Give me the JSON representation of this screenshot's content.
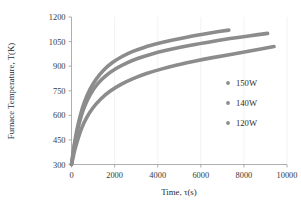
{
  "chart_data": {
    "type": "line",
    "title": "",
    "xlabel": "Time, τ(s)",
    "ylabel": "Furnace Temperature, T(K)",
    "xlim": [
      0,
      10000
    ],
    "ylim": [
      300,
      1200
    ],
    "xticks": [
      0,
      2000,
      4000,
      6000,
      8000,
      10000
    ],
    "yticks": [
      300,
      450,
      600,
      750,
      900,
      1050,
      1200
    ],
    "xtick_labels": [
      "0",
      "2000",
      "4000",
      "6000",
      "8000",
      "10000"
    ],
    "ytick_labels": [
      "300",
      "450",
      "600",
      "750",
      "900",
      "1050",
      "1200"
    ],
    "grid": "vertical-only",
    "legend_position": "right-middle",
    "marker_style": "small-round-dot",
    "series": [
      {
        "name": "150W",
        "color": "#8c8c8c",
        "x": [
          0,
          60,
          140,
          250,
          400,
          600,
          850,
          1150,
          1500,
          1900,
          2350,
          2850,
          3400,
          4000,
          4650,
          5350,
          6100,
          6700,
          7300
        ],
        "values": [
          300,
          360,
          430,
          510,
          595,
          680,
          757,
          822,
          877,
          922,
          959,
          990,
          1016,
          1038,
          1058,
          1077,
          1095,
          1108,
          1120
        ]
      },
      {
        "name": "140W",
        "color": "#8c8c8c",
        "x": [
          0,
          60,
          140,
          250,
          400,
          600,
          870,
          1200,
          1600,
          2050,
          2550,
          3100,
          3700,
          4350,
          5050,
          5800,
          6600,
          7450,
          8300,
          9100
        ],
        "values": [
          300,
          352,
          418,
          492,
          572,
          652,
          727,
          790,
          842,
          884,
          919,
          948,
          973,
          995,
          1015,
          1034,
          1052,
          1070,
          1086,
          1100
        ]
      },
      {
        "name": "120W",
        "color": "#8c8c8c",
        "x": [
          0,
          70,
          160,
          290,
          460,
          690,
          990,
          1360,
          1800,
          2300,
          2860,
          3480,
          4160,
          4900,
          5700,
          6550,
          7450,
          8400,
          9400
        ],
        "values": [
          300,
          340,
          392,
          452,
          518,
          583,
          645,
          700,
          748,
          789,
          824,
          855,
          882,
          907,
          930,
          952,
          973,
          996,
          1020
        ]
      }
    ]
  },
  "axes": {
    "y_title": "Furnace Temperature, T(K)",
    "x_title": "Time, τ(s)"
  },
  "legend": {
    "items": [
      {
        "label": "150W",
        "color": "#8c8c8c"
      },
      {
        "label": "140W",
        "color": "#8c8c8c"
      },
      {
        "label": "120W",
        "color": "#8c8c8c"
      }
    ]
  },
  "colors": {
    "series_gray": "#8c8c8c",
    "axis_gray": "#9a9a9a",
    "grid_gray": "#ededed",
    "text": "#2b2b2b",
    "background": "#ffffff"
  }
}
